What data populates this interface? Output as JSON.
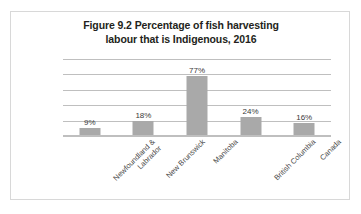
{
  "figure": {
    "title_line1": "Figure 9.2 Percentage of fish harvesting",
    "title_line2": "labour that is Indigenous, 2016"
  },
  "chart_data": {
    "type": "bar",
    "title": "Figure 9.2 Percentage of fish harvesting labour that is Indigenous, 2016",
    "xlabel": "",
    "ylabel": "",
    "ylim": [
      0,
      100
    ],
    "grid": true,
    "gridline_values": [
      100,
      80,
      60,
      40,
      20,
      0
    ],
    "legend": "none",
    "bar_color": "#a9a9a9",
    "gridline_color": "#bfbfbf",
    "categories": [
      "Newfoundland & Labrador",
      "New Brunswick",
      "Manitoba",
      "British Columbia",
      "Canada"
    ],
    "category_lines": [
      [
        "Newfoundland &",
        "Labrador"
      ],
      [
        "New Brunswick"
      ],
      [
        "Manitoba"
      ],
      [
        "British Columbia"
      ],
      [
        "Canada"
      ]
    ],
    "values": [
      9,
      18,
      77,
      24,
      16
    ],
    "data_labels": [
      "9%",
      "18%",
      "77%",
      "24%",
      "16%"
    ]
  }
}
